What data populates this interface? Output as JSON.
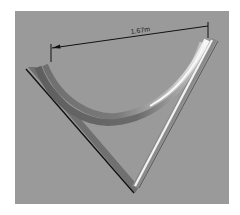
{
  "figure": {
    "background_color": "#9a9a9a",
    "dimension": {
      "label": "1.67m",
      "line_color": "#111111"
    },
    "objects": [
      {
        "name": "curved-rail",
        "shape": "arc",
        "color": "#7d7d7d",
        "highlight": "#f2f2f2"
      },
      {
        "name": "v-frame",
        "shape": "v",
        "color": "#6e6e6e",
        "highlight": "#f4f4f4"
      }
    ]
  }
}
